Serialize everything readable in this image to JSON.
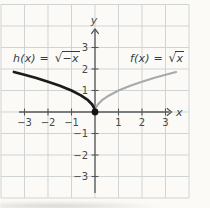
{
  "figure": {
    "background": "#fbfaf6",
    "grid_color": "#cbd0d2",
    "axis_color": "#56575a",
    "tick_label_color": "#47484a",
    "function_label_color": "#3a3a3c",
    "origin_dot_color": "#141414"
  },
  "labels": {
    "h": {
      "prefix": "h(x) = ",
      "radical_icon": "√",
      "radicand": "−x"
    },
    "f": {
      "prefix": "f(x) = ",
      "radical_icon": "√",
      "radicand": "x"
    }
  },
  "chart_data": {
    "type": "line",
    "title": "",
    "xlabel": "x",
    "ylabel": "y",
    "xlim": [
      -4,
      4
    ],
    "ylim": [
      -4,
      5
    ],
    "grid": true,
    "x_ticks": [
      -3,
      -2,
      -1,
      1,
      2,
      3
    ],
    "y_ticks": [
      -3,
      -2,
      -1,
      1,
      2,
      3
    ],
    "origin_point": [
      0,
      0
    ],
    "series": [
      {
        "name": "h(x) = √(−x)",
        "color": "#1b1b1b",
        "stroke_width": 2.7,
        "points": [
          [
            -3.45,
            1.86
          ],
          [
            -3,
            1.73
          ],
          [
            -2.5,
            1.58
          ],
          [
            -2,
            1.41
          ],
          [
            -1.5,
            1.22
          ],
          [
            -1,
            1.0
          ],
          [
            -0.6,
            0.77
          ],
          [
            -0.3,
            0.55
          ],
          [
            -0.12,
            0.35
          ],
          [
            -0.03,
            0.17
          ],
          [
            0,
            0
          ]
        ]
      },
      {
        "name": "f(x) = √x",
        "color": "#a8abae",
        "stroke_width": 2.2,
        "points": [
          [
            0,
            0
          ],
          [
            0.03,
            0.17
          ],
          [
            0.12,
            0.35
          ],
          [
            0.3,
            0.55
          ],
          [
            0.6,
            0.77
          ],
          [
            1,
            1.0
          ],
          [
            1.5,
            1.22
          ],
          [
            2,
            1.41
          ],
          [
            2.5,
            1.58
          ],
          [
            3,
            1.73
          ],
          [
            3.45,
            1.86
          ]
        ]
      }
    ]
  }
}
